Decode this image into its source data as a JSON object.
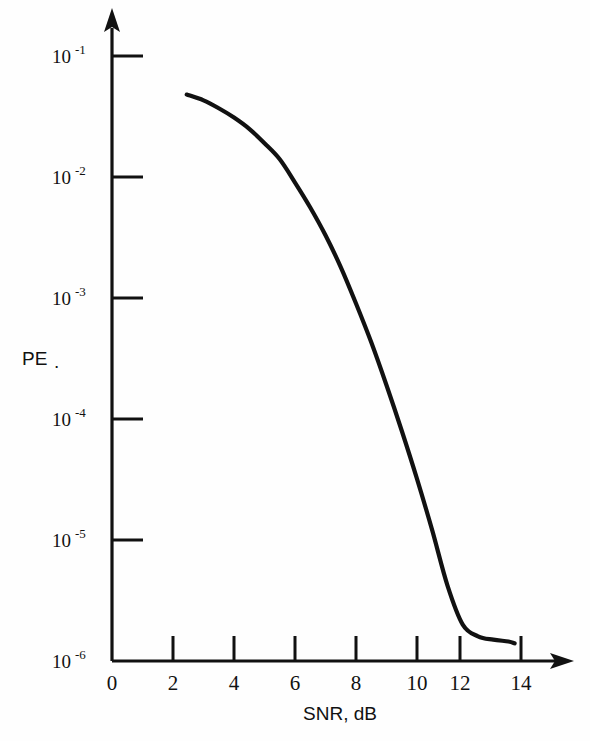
{
  "figure": {
    "background_color": "#fefefe",
    "ink_color": "#111111"
  },
  "chart_data": {
    "type": "line",
    "title": "",
    "subtitle": "",
    "xlabel": "SNR, dB",
    "ylabel": "PE.",
    "ylabel_text": "PE",
    "ylabel_suffix": ".",
    "xlim": [
      0,
      15
    ],
    "ylim": [
      1e-06,
      0.1
    ],
    "yscale": "log",
    "xscale": "linear",
    "grid": false,
    "legend": null,
    "legend_position": "none",
    "x_ticks": [
      0,
      2,
      4,
      6,
      8,
      10,
      12,
      14
    ],
    "x_tick_labels": [
      "0",
      "2",
      "4",
      "6",
      "8",
      "10",
      "12",
      "14"
    ],
    "y_ticks": [
      0.1,
      0.01,
      0.001,
      0.0001,
      1e-05,
      1e-06
    ],
    "y_tick_labels": [
      "10-1",
      "10-2",
      "10-3",
      "10-4",
      "10-5",
      "10-6"
    ],
    "y_tick_mantissa": [
      "10",
      "10",
      "10",
      "10",
      "10",
      "10"
    ],
    "y_tick_exponents": [
      "-1",
      "-2",
      "-3",
      "-4",
      "-5",
      "-6"
    ],
    "axis_arrows": [
      "x-right",
      "y-up"
    ],
    "series": [
      {
        "name": "PE vs SNR",
        "color": "#111111",
        "x": [
          2.45,
          3.0,
          3.5,
          4.0,
          4.5,
          5.0,
          5.5,
          6.0,
          6.5,
          7.0,
          7.5,
          8.0,
          8.5,
          9.0,
          9.5,
          10.0,
          10.5,
          11.0,
          11.5,
          12.0,
          12.5,
          13.0,
          13.2
        ],
        "y": [
          0.048,
          0.043,
          0.037,
          0.031,
          0.025,
          0.019,
          0.014,
          0.009,
          0.0056,
          0.0033,
          0.0018,
          0.0009,
          0.00043,
          0.00019,
          8e-05,
          3.2e-05,
          1.2e-05,
          4.2e-06,
          2e-06,
          1.6e-06,
          1.5e-06,
          1.45e-06,
          1.4e-06
        ]
      }
    ]
  },
  "annotations": []
}
